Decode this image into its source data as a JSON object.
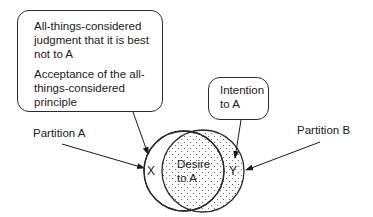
{
  "diagram": {
    "box_judgment": {
      "line1": "All-things-considered judgment that it is best not to A",
      "line2": "Acceptance of the all-things-considered principle"
    },
    "box_intention": {
      "text": "Intention to A"
    },
    "partition_a": "Partition A",
    "partition_b": "Partition B",
    "region_x": "X",
    "region_y": "Y",
    "center_label": "Desire to A",
    "colors": {
      "stroke": "#2a2a2a",
      "background": "#ffffff",
      "stipple": "#555555"
    }
  }
}
